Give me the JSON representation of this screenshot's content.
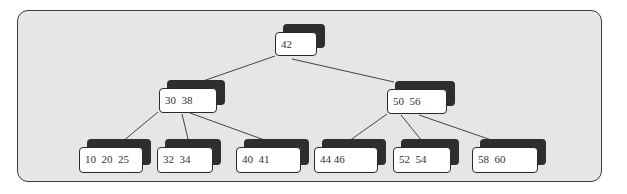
{
  "diagram": {
    "type": "b-tree",
    "nodes": {
      "root": {
        "keys": "42"
      },
      "left": {
        "keys": "30  38"
      },
      "right": {
        "keys": "50  56"
      },
      "leaf1": {
        "keys": "10  20  25"
      },
      "leaf2": {
        "keys": "32  34"
      },
      "leaf3": {
        "keys": "40  41"
      },
      "leaf4": {
        "keys": "44 46"
      },
      "leaf5": {
        "keys": "52  54"
      },
      "leaf6": {
        "keys": "58  60"
      }
    },
    "edges": [
      [
        "root",
        "left"
      ],
      [
        "root",
        "right"
      ],
      [
        "left",
        "leaf1"
      ],
      [
        "left",
        "leaf2"
      ],
      [
        "left",
        "leaf3"
      ],
      [
        "right",
        "leaf4"
      ],
      [
        "right",
        "leaf5"
      ],
      [
        "right",
        "leaf6"
      ]
    ]
  }
}
